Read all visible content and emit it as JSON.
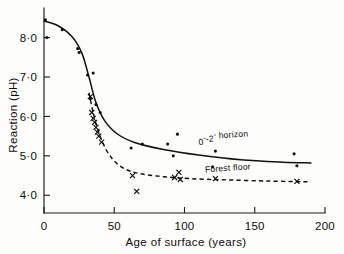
{
  "chart_data": {
    "type": "scatter",
    "title": "",
    "xlabel": "Age of surface (years)",
    "ylabel": "Reaction (pH)",
    "xlim": [
      0,
      200
    ],
    "ylim": [
      3.55,
      8.75
    ],
    "xticks": [
      0,
      50,
      100,
      150,
      200
    ],
    "xtick_labels": [
      "0",
      "50",
      "100",
      "150",
      "200"
    ],
    "yticks": [
      4.0,
      5.0,
      6.0,
      7.0,
      8.0
    ],
    "ytick_labels": [
      "4·0",
      "5·0",
      "6·0",
      "7·0",
      "8·0"
    ],
    "grid": false,
    "legend_position": "inline-annotation",
    "series": [
      {
        "name": "0″-2″ horizon",
        "marker": "dot",
        "line_style": "solid",
        "annotation": "0″-2″ horizon",
        "annotation_x": 128,
        "annotation_y": 5.32,
        "points": [
          {
            "x": 1,
            "y": 8.45
          },
          {
            "x": 2,
            "y": 8.0
          },
          {
            "x": 13,
            "y": 8.2
          },
          {
            "x": 24,
            "y": 7.72
          },
          {
            "x": 25,
            "y": 7.62
          },
          {
            "x": 31,
            "y": 7.05
          },
          {
            "x": 35,
            "y": 7.1
          },
          {
            "x": 33,
            "y": 6.45
          },
          {
            "x": 37,
            "y": 6.3
          },
          {
            "x": 40,
            "y": 6.1
          },
          {
            "x": 62,
            "y": 5.2
          },
          {
            "x": 70,
            "y": 5.3
          },
          {
            "x": 88,
            "y": 5.3
          },
          {
            "x": 92,
            "y": 5.0
          },
          {
            "x": 95,
            "y": 5.55
          },
          {
            "x": 120,
            "y": 4.72
          },
          {
            "x": 122,
            "y": 5.12
          },
          {
            "x": 178,
            "y": 5.05
          },
          {
            "x": 180,
            "y": 4.75
          }
        ],
        "curve": [
          {
            "x": 0,
            "y": 8.42
          },
          {
            "x": 10,
            "y": 8.3
          },
          {
            "x": 20,
            "y": 8.02
          },
          {
            "x": 27,
            "y": 7.6
          },
          {
            "x": 32,
            "y": 7.0
          },
          {
            "x": 37,
            "y": 6.35
          },
          {
            "x": 43,
            "y": 5.9
          },
          {
            "x": 52,
            "y": 5.56
          },
          {
            "x": 65,
            "y": 5.33
          },
          {
            "x": 85,
            "y": 5.16
          },
          {
            "x": 110,
            "y": 5.02
          },
          {
            "x": 140,
            "y": 4.9
          },
          {
            "x": 170,
            "y": 4.84
          },
          {
            "x": 190,
            "y": 4.82
          }
        ]
      },
      {
        "name": "Forest floor",
        "marker": "cross",
        "line_style": "dashed",
        "annotation": "Forest floor",
        "annotation_x": 131,
        "annotation_y": 4.62,
        "points": [
          {
            "x": 33,
            "y": 6.5
          },
          {
            "x": 34,
            "y": 6.1
          },
          {
            "x": 35,
            "y": 5.95
          },
          {
            "x": 36,
            "y": 5.85
          },
          {
            "x": 37,
            "y": 5.72
          },
          {
            "x": 38,
            "y": 5.6
          },
          {
            "x": 39,
            "y": 5.5
          },
          {
            "x": 41,
            "y": 5.35
          },
          {
            "x": 63,
            "y": 4.5
          },
          {
            "x": 66,
            "y": 4.1
          },
          {
            "x": 93,
            "y": 4.45
          },
          {
            "x": 96,
            "y": 4.58
          },
          {
            "x": 97,
            "y": 4.4
          },
          {
            "x": 122,
            "y": 4.42
          },
          {
            "x": 180,
            "y": 4.35
          }
        ],
        "curve": [
          {
            "x": 32,
            "y": 6.6
          },
          {
            "x": 36,
            "y": 5.95
          },
          {
            "x": 41,
            "y": 5.4
          },
          {
            "x": 48,
            "y": 4.95
          },
          {
            "x": 57,
            "y": 4.68
          },
          {
            "x": 68,
            "y": 4.55
          },
          {
            "x": 85,
            "y": 4.47
          },
          {
            "x": 105,
            "y": 4.42
          },
          {
            "x": 130,
            "y": 4.39
          },
          {
            "x": 160,
            "y": 4.36
          },
          {
            "x": 190,
            "y": 4.34
          }
        ]
      }
    ]
  }
}
